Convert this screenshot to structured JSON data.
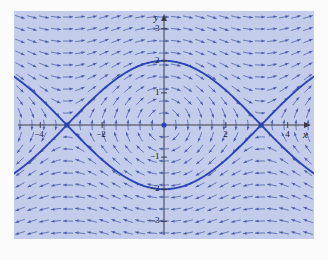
{
  "figure": {
    "kind": "phase-portrait",
    "background_color": "#c3cdeb",
    "page_color": "#fbfbfc",
    "field_color": "#4558a8",
    "curve_color": "#2b46b4",
    "axis_color": "#3a3a4a",
    "equilibrium_color": "#2b46b4"
  },
  "axes": {
    "x_label": "x",
    "y_label": "y",
    "x_ticks": [
      {
        "value": -4,
        "label": "−4"
      },
      {
        "value": -2,
        "label": "−2"
      },
      {
        "value": 2,
        "label": "2"
      },
      {
        "value": 4,
        "label": "4"
      }
    ],
    "y_ticks": [
      {
        "value": 3,
        "label": "3"
      },
      {
        "value": 2,
        "label": "2"
      },
      {
        "value": 1,
        "label": "1"
      },
      {
        "value": -1,
        "label": "−1"
      },
      {
        "value": -2,
        "label": "−2"
      },
      {
        "value": -3,
        "label": "−3"
      }
    ]
  },
  "chart_data": {
    "type": "scatter",
    "title": "",
    "xlabel": "x",
    "ylabel": "y",
    "xlim": [
      -4.85,
      4.85
    ],
    "ylim": [
      -3.55,
      3.55
    ],
    "grid": false,
    "legend": "none",
    "system": {
      "description": "pendulum direction field: x' = y, y' = -sin(x)",
      "dx": "y",
      "dy": "-sin(x)"
    },
    "equilibria": [
      {
        "x": 0,
        "y": 0,
        "kind": "center"
      },
      {
        "x": -3.14159,
        "y": 0,
        "kind": "saddle"
      },
      {
        "x": 3.14159,
        "y": 0,
        "kind": "saddle"
      }
    ],
    "separatrices": [
      {
        "name": "upper-separatrix",
        "equation": "y = 2cos(x/2)",
        "x_range": [
          -3.14159,
          3.14159
        ]
      },
      {
        "name": "lower-separatrix",
        "equation": "y = -2cos(x/2)",
        "x_range": [
          -3.14159,
          3.14159
        ]
      },
      {
        "name": "left-outer-upper",
        "equation": "y = -2cos(x/2)",
        "x_range": [
          -4.85,
          -3.14159
        ]
      },
      {
        "name": "left-outer-lower",
        "equation": "y = 2cos(x/2)",
        "x_range": [
          -4.85,
          -3.14159
        ]
      },
      {
        "name": "right-outer-upper",
        "equation": "y = -2cos(x/2)",
        "x_range": [
          3.14159,
          4.85
        ]
      },
      {
        "name": "right-outer-lower",
        "equation": "y = 2cos(x/2)",
        "x_range": [
          3.14159,
          4.85
        ]
      }
    ],
    "field_grid": {
      "x_count": 25,
      "y_count": 19,
      "arrow_style": "curved-tangent-with-head"
    }
  }
}
